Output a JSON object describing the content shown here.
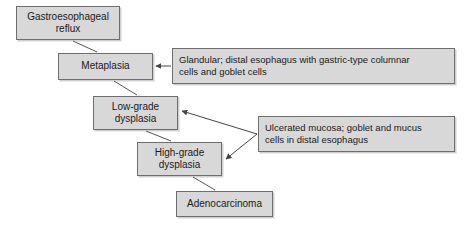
{
  "figure": {
    "background_color": "#ffffff",
    "box_fill_color": "#d8d8d8",
    "box_border_color": "#6e6e6e",
    "connector_color": "#555555"
  },
  "nodes": [
    {
      "id": "reflux",
      "label": "Gastroesophageal\nreflux"
    },
    {
      "id": "meta",
      "label": "Metaplasia"
    },
    {
      "id": "lowgrade",
      "label": "Low-grade\ndysplasia"
    },
    {
      "id": "highgrade",
      "label": "High-grade\ndysplasia"
    },
    {
      "id": "adeno",
      "label": "Adenocarcinoma"
    }
  ],
  "annotations": [
    {
      "id": "glandular",
      "label": "Glandular; distal esophagus with gastric-type columnar\ncells and goblet cells",
      "targets": [
        "Metaplasia"
      ]
    },
    {
      "id": "ulcerated",
      "label": "Ulcerated mucosa; goblet and mucus\ncells in distal esophagus",
      "targets": [
        "Low-grade dysplasia",
        "High-grade dysplasia"
      ]
    }
  ],
  "connectors": [
    {
      "from": "Gastroesophageal reflux",
      "to": "Metaplasia",
      "arrowhead": false
    },
    {
      "from": "Metaplasia",
      "to": "Low-grade dysplasia",
      "arrowhead": false
    },
    {
      "from": "Low-grade dysplasia",
      "to": "High-grade dysplasia",
      "arrowhead": false
    },
    {
      "from": "High-grade dysplasia",
      "to": "Adenocarcinoma",
      "arrowhead": false
    },
    {
      "from": "Glandular annotation",
      "to": "Metaplasia",
      "arrowhead": true
    },
    {
      "from": "Ulcerated annotation",
      "to": "Low-grade dysplasia",
      "arrowhead": true
    },
    {
      "from": "Ulcerated annotation",
      "to": "High-grade dysplasia",
      "arrowhead": true
    }
  ]
}
